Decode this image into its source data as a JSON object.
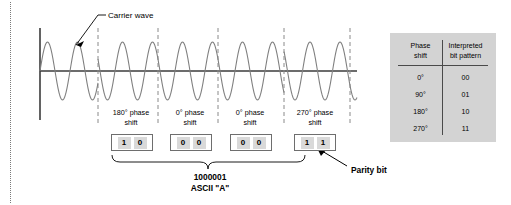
{
  "diagram": {
    "carrier_label": "Carrier wave",
    "parity_label": "Parity bit",
    "ascii_bits": "1000001",
    "ascii_caption": "ASCII \"A\"",
    "axis": {
      "origin_x": 40,
      "baseline_y": 71,
      "axis_end_x": 357,
      "axis_top_y": 28,
      "axis_bottom_y": 120
    },
    "wave": {
      "amplitude": 29,
      "period": 30,
      "segment_boundaries_x": [
        98,
        158,
        218,
        284,
        350
      ],
      "stroke_color": "#808080"
    },
    "symbols": [
      {
        "phase_line_1": "180° phase",
        "phase_line_2": "shift",
        "bits": [
          "1",
          "0"
        ],
        "label_center_x": 131,
        "box_left": 111,
        "box_width": 42
      },
      {
        "phase_line_1": "0° phase",
        "phase_line_2": "shift",
        "bits": [
          "0",
          "0"
        ],
        "label_center_x": 190,
        "box_left": 170,
        "box_width": 42
      },
      {
        "phase_line_1": "0° phase",
        "phase_line_2": "shift",
        "bits": [
          "0",
          "0"
        ],
        "label_center_x": 250,
        "box_left": 230,
        "box_width": 42
      },
      {
        "phase_line_1": "270° phase",
        "phase_line_2": "shift",
        "bits": [
          "1",
          "1"
        ],
        "label_center_x": 315,
        "box_left": 294,
        "box_width": 42
      }
    ]
  },
  "reference_table": {
    "header": [
      "Phase shift",
      "Interpreted bit pattern"
    ],
    "header_line1": [
      "Phase",
      "Interpreted"
    ],
    "header_line2": [
      "shift",
      "bit pattern"
    ],
    "rows": [
      {
        "phase": "0°",
        "pattern": "00"
      },
      {
        "phase": "90°",
        "pattern": "01"
      },
      {
        "phase": "180°",
        "pattern": "10"
      },
      {
        "phase": "270°",
        "pattern": "11"
      }
    ],
    "background_color": "#d3d3d3"
  },
  "colors": {
    "wave_stroke": "#808080",
    "axis": "#3b3b3b",
    "dashed_guide": "#8a8a8a",
    "bit_cell_fill": "#d9d9d9",
    "bit_box_border": "#6e6e6e",
    "table_bg": "#d3d3d3",
    "text": "#000000"
  }
}
